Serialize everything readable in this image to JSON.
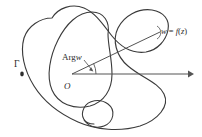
{
  "figure": {
    "background_color": "#ffffff",
    "curve_color": "#3a3a3a",
    "axis_color": "#555555",
    "label_color": "#2b2b2b",
    "width": 202,
    "height": 137
  },
  "labels": {
    "gamma": "Γ",
    "arg_w_prefix": "Arg",
    "arg_w_variable": "w",
    "origin": "O",
    "w_equals_prefix": "w",
    "w_equals_sign": " = ",
    "w_equals_f": "f",
    "w_equals_open": "(",
    "w_equals_z": "z",
    "w_equals_close": ")"
  },
  "geometry": {
    "origin_point": {
      "x": 72,
      "y": 74
    },
    "w_point": {
      "x": 160,
      "y": 32
    },
    "axis_start": {
      "x": 72,
      "y": 74
    },
    "axis_end": {
      "x": 190,
      "y": 74
    },
    "arrow_tip": {
      "x": 192,
      "y": 74
    },
    "gamma_tick": {
      "x": 22,
      "y": 74
    },
    "angle_arc_radius": 22,
    "angle_degrees": 26
  },
  "icons": {
    "arrow_right": "arrow-right-icon",
    "contour_outer": "closed-contour-icon",
    "contour_inner": "inner-contour-icon",
    "contour_loop": "small-loop-icon"
  }
}
